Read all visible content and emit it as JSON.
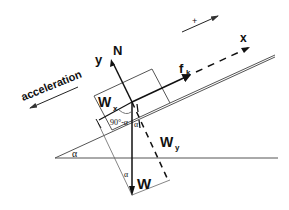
{
  "diagram": {
    "labels": {
      "acceleration": "acceleration",
      "plus_direction": "+",
      "x_axis": "x",
      "y_axis": "y",
      "normal_force": "N",
      "friction_force": "f",
      "friction_subscript": "k",
      "weight": "W",
      "weight_x": "W",
      "weight_x_subscript": "x",
      "weight_y": "W",
      "weight_y_subscript": "y",
      "angle_complement": "90°-α",
      "angle_alpha_incline": "α",
      "angle_alpha_weight": "α",
      "angle_alpha_triangle": "α"
    },
    "colors": {
      "line": "#555555",
      "vector": "#111111",
      "background": "#ffffff"
    }
  }
}
